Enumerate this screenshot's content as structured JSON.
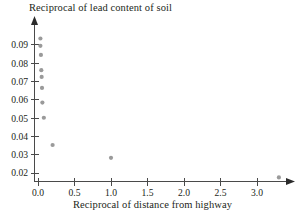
{
  "chart_data": {
    "type": "scatter",
    "title": "Reciprocal of lead content of soil",
    "xlabel": "Reciprocal of distance from highway",
    "ylabel": "",
    "grid": false,
    "legend": "none",
    "point_color": "#9a9a9a",
    "axis_color": "#4a4a4a",
    "xlim": [
      -0.12,
      3.62
    ],
    "ylim": [
      0.0135,
      0.0975
    ],
    "xticks": [
      "0.0",
      "0.5",
      "1.0",
      "1.5",
      "2.0",
      "2.5",
      "3.0"
    ],
    "xtick_values": [
      0.0,
      0.5,
      1.0,
      1.5,
      2.0,
      2.5,
      3.0
    ],
    "yticks": [
      "0.02",
      "0.03",
      "0.04",
      "0.05",
      "0.06",
      "0.07",
      "0.08",
      "0.09"
    ],
    "ytick_values": [
      0.02,
      0.03,
      0.04,
      0.05,
      0.06,
      0.07,
      0.08,
      0.09
    ],
    "x": [
      0.033,
      0.033,
      0.04,
      0.045,
      0.05,
      0.055,
      0.06,
      0.08,
      0.2,
      1.0,
      3.3
    ],
    "y": [
      0.0935,
      0.0895,
      0.0845,
      0.0762,
      0.0725,
      0.0665,
      0.0585,
      0.0502,
      0.0353,
      0.0283,
      0.0176
    ],
    "points": [
      {
        "x": 0.033,
        "y": 0.0935
      },
      {
        "x": 0.033,
        "y": 0.0895
      },
      {
        "x": 0.04,
        "y": 0.0845
      },
      {
        "x": 0.045,
        "y": 0.0762
      },
      {
        "x": 0.05,
        "y": 0.0725
      },
      {
        "x": 0.055,
        "y": 0.0665
      },
      {
        "x": 0.06,
        "y": 0.0585
      },
      {
        "x": 0.08,
        "y": 0.0502
      },
      {
        "x": 0.2,
        "y": 0.0353
      },
      {
        "x": 1.0,
        "y": 0.0283
      },
      {
        "x": 3.3,
        "y": 0.0176
      }
    ]
  }
}
